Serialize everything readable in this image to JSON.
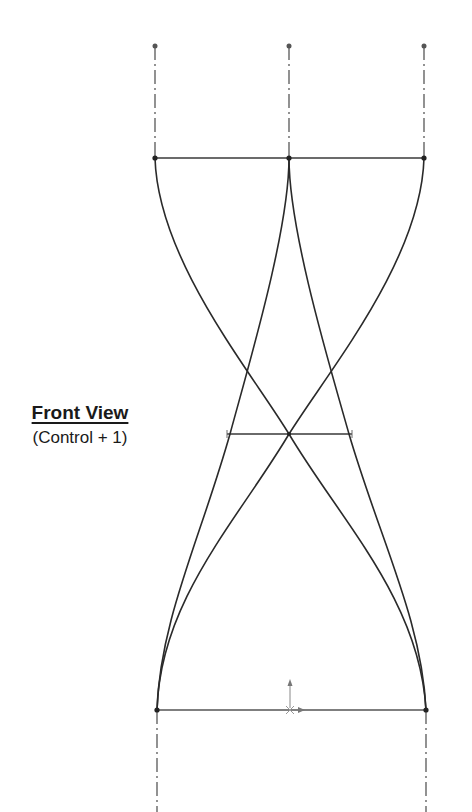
{
  "label": {
    "title": "Front View",
    "shortcut": "(Control + 1)"
  },
  "sketch": {
    "line_color": "#2a2a2a",
    "dimension_color": "#6a6a6a",
    "centerline_color": "#4a4a4a"
  }
}
